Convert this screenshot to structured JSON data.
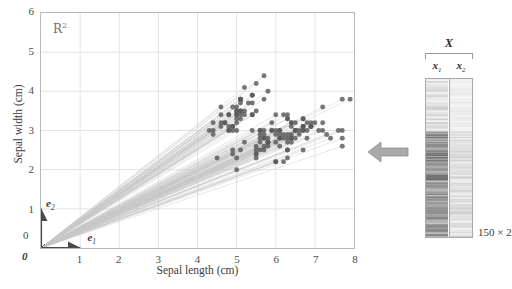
{
  "figure": {
    "space_label": "R",
    "space_label_sup": "2"
  },
  "axes": {
    "x_title": "Sepal length (cm)",
    "y_title": "Sepal width (cm)",
    "x_ticks": [
      "0",
      "1",
      "2",
      "3",
      "4",
      "5",
      "6",
      "7",
      "8"
    ],
    "y_ticks": [
      "0",
      "1",
      "2",
      "3",
      "4",
      "5",
      "6"
    ],
    "xlim": [
      0,
      8
    ],
    "ylim": [
      0,
      6
    ],
    "grid": true
  },
  "annotations": {
    "basis_e1": "e",
    "basis_e1_sub": "1",
    "basis_e2": "e",
    "basis_e2_sub": "2",
    "origin_tick": "0",
    "origin_vector": "0"
  },
  "matrix": {
    "title": "X",
    "col1": "x",
    "col1_sub": "1",
    "col2": "x",
    "col2_sub": "2",
    "dims": "150 × 2",
    "rows": 150,
    "cols": 2
  },
  "colors": {
    "point": "#595959",
    "ray": "#c9c9c9",
    "grid": "#e3e3e3",
    "frame": "#b9b9b9",
    "arrow": "#a6a6a6",
    "text": "#3b3b3b"
  },
  "chart_data": {
    "type": "scatter",
    "title": "",
    "xlabel": "Sepal length (cm)",
    "ylabel": "Sepal width (cm)",
    "xlim": [
      0,
      8
    ],
    "ylim": [
      0,
      6
    ],
    "grid": true,
    "legend": "none",
    "series": [
      {
        "name": "iris sepal measurements (vectors from origin)",
        "x": [
          5.1,
          4.9,
          4.7,
          4.6,
          5.0,
          5.4,
          4.6,
          5.0,
          4.4,
          4.9,
          5.4,
          4.8,
          4.8,
          4.3,
          5.8,
          5.7,
          5.4,
          5.1,
          5.7,
          5.1,
          5.4,
          5.1,
          4.6,
          5.1,
          4.8,
          5.0,
          5.0,
          5.2,
          5.2,
          4.7,
          4.8,
          5.4,
          5.2,
          5.5,
          4.9,
          5.0,
          5.5,
          4.9,
          4.4,
          5.1,
          5.0,
          4.5,
          4.4,
          5.0,
          5.1,
          4.8,
          5.1,
          4.6,
          5.3,
          5.0,
          7.0,
          6.4,
          6.9,
          5.5,
          6.5,
          5.7,
          6.3,
          4.9,
          6.6,
          5.2,
          5.0,
          5.9,
          6.0,
          6.1,
          5.6,
          6.7,
          5.6,
          5.8,
          6.2,
          5.6,
          5.9,
          6.1,
          6.3,
          6.1,
          6.4,
          6.6,
          6.8,
          6.7,
          6.0,
          5.7,
          5.5,
          5.5,
          5.8,
          6.0,
          5.4,
          6.0,
          6.7,
          6.3,
          5.6,
          5.5,
          5.5,
          6.1,
          5.8,
          5.0,
          5.6,
          5.7,
          5.7,
          6.2,
          5.1,
          5.7,
          6.3,
          5.8,
          7.1,
          6.3,
          6.5,
          7.6,
          4.9,
          7.3,
          6.7,
          7.2,
          6.5,
          6.4,
          6.8,
          5.7,
          5.8,
          6.4,
          6.5,
          7.7,
          7.7,
          6.0,
          6.9,
          5.6,
          7.7,
          6.3,
          6.7,
          7.2,
          6.2,
          6.1,
          6.4,
          7.2,
          7.4,
          7.9,
          6.4,
          6.3,
          6.1,
          7.7,
          6.3,
          6.4,
          6.0,
          6.9,
          6.7,
          6.9,
          5.8,
          6.8,
          6.7,
          6.7,
          6.3,
          6.5,
          6.2,
          5.9
        ],
        "y": [
          3.5,
          3.0,
          3.2,
          3.1,
          3.6,
          3.9,
          3.4,
          3.4,
          2.9,
          3.1,
          3.7,
          3.4,
          3.0,
          3.0,
          4.0,
          4.4,
          3.9,
          3.5,
          3.8,
          3.8,
          3.4,
          3.7,
          3.6,
          3.3,
          3.4,
          3.0,
          3.4,
          3.5,
          3.4,
          3.2,
          3.1,
          3.4,
          4.1,
          4.2,
          3.1,
          3.2,
          3.5,
          3.6,
          3.0,
          3.4,
          3.5,
          2.3,
          3.2,
          3.5,
          3.8,
          3.0,
          3.8,
          3.2,
          3.7,
          3.3,
          3.2,
          3.2,
          3.1,
          2.3,
          2.8,
          2.8,
          3.3,
          2.4,
          2.9,
          2.7,
          2.0,
          3.0,
          2.2,
          2.9,
          2.9,
          3.1,
          3.0,
          2.7,
          2.2,
          2.5,
          3.2,
          2.8,
          2.5,
          2.8,
          2.9,
          3.0,
          2.8,
          3.0,
          2.9,
          2.6,
          2.4,
          2.4,
          2.7,
          2.7,
          3.0,
          3.4,
          3.1,
          2.3,
          3.0,
          2.5,
          2.6,
          3.0,
          2.6,
          2.3,
          2.7,
          3.0,
          2.9,
          2.9,
          2.5,
          2.8,
          3.3,
          2.7,
          3.0,
          2.9,
          3.0,
          3.0,
          2.5,
          2.9,
          2.5,
          3.6,
          3.2,
          2.7,
          3.0,
          2.5,
          2.8,
          3.2,
          3.0,
          3.8,
          2.6,
          2.2,
          3.2,
          2.8,
          2.8,
          2.7,
          3.3,
          3.2,
          2.8,
          3.0,
          2.8,
          3.0,
          2.8,
          3.8,
          2.8,
          2.8,
          2.6,
          3.0,
          3.4,
          3.1,
          3.0,
          3.1,
          3.1,
          3.1,
          2.7,
          3.2,
          3.3,
          3.0,
          2.5,
          3.0,
          3.4,
          3.0
        ]
      }
    ]
  }
}
